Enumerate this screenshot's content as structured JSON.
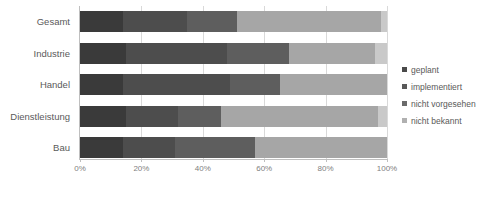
{
  "chart_data": {
    "type": "bar",
    "orientation": "horizontal",
    "stacked": true,
    "normalized_percent": true,
    "title": "",
    "subtitle": "",
    "xlabel": "",
    "ylabel": "",
    "xlim": [
      0,
      100
    ],
    "xticks": [
      0,
      20,
      40,
      60,
      80,
      100
    ],
    "xtick_labels": [
      "0%",
      "20%",
      "40%",
      "60%",
      "80%",
      "100%"
    ],
    "grid": true,
    "grid_axis": "x",
    "legend_position": "right",
    "categories": [
      "Gesamt",
      "Industrie",
      "Handel",
      "Dienstleistung",
      "Bau"
    ],
    "series": [
      {
        "name": "geplant",
        "color": "#3a3a3a",
        "values": [
          14,
          15,
          14,
          15,
          14
        ]
      },
      {
        "name": "implementiert",
        "color": "#4d4d4d",
        "values": [
          21,
          33,
          35,
          17,
          17
        ]
      },
      {
        "name": "nicht vorgesehen",
        "color": "#5e5e5e",
        "values": [
          16,
          20,
          16,
          14,
          26
        ]
      },
      {
        "name": "nicht bekannt",
        "color": "#a6a6a6",
        "values": [
          47,
          28,
          35,
          51,
          43
        ]
      },
      {
        "name": "rest",
        "color": "#c9c9c9",
        "values": [
          2,
          4,
          0,
          3,
          0
        ]
      }
    ],
    "annotations": []
  },
  "legend": {
    "items": [
      {
        "label": "geplant",
        "color": "#4a4a4a"
      },
      {
        "label": "implementiert",
        "color": "#595959"
      },
      {
        "label": "nicht vorgesehen",
        "color": "#6b6b6b"
      },
      {
        "label": "nicht bekannt",
        "color": "#b0b0b0"
      }
    ]
  },
  "axis": {
    "x_tick_labels": [
      "0%",
      "20%",
      "40%",
      "60%",
      "80%",
      "100%"
    ],
    "x_tick_values": [
      0,
      20,
      40,
      60,
      80,
      100
    ]
  }
}
